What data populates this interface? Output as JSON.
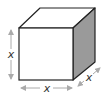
{
  "diagram": {
    "type": "cube-dimensions",
    "labels": {
      "height": "x",
      "width": "x",
      "depth": "x"
    },
    "colors": {
      "front_face": "#ffffff",
      "top_face": "#ffffff",
      "side_face": "#9a9a9a",
      "edge": "#222222",
      "arrow": "#aaaaaa",
      "label": "#333333"
    }
  }
}
